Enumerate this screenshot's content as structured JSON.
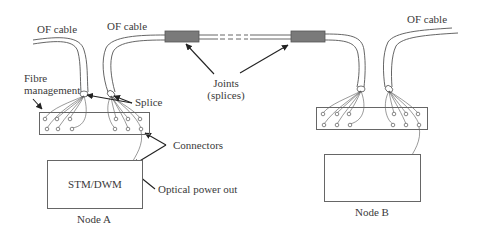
{
  "diagram": {
    "labels": {
      "of_cable_left": "OF cable",
      "of_cable_middle": "OF cable",
      "of_cable_right": "OF cable",
      "fibre_management_line1": "Fibre",
      "fibre_management_line2": "management",
      "splice": "Splice",
      "joints_line1": "Joints",
      "joints_line2": "(splices)",
      "connectors": "Connectors",
      "optical_power_out": "Optical power out"
    },
    "nodes": [
      {
        "id": "A",
        "name": "Node A",
        "equipment": "STM/DWM"
      },
      {
        "id": "B",
        "name": "Node B",
        "equipment": ""
      }
    ],
    "joints": [
      {
        "label": "joint-1",
        "color": "#7a7a7a"
      },
      {
        "label": "joint-2",
        "color": "#7a7a7a"
      }
    ],
    "colors": {
      "line": "#555555",
      "joint_fill": "#7a7a7a",
      "arrow": "#222222",
      "text": "#3a3a3a"
    }
  }
}
